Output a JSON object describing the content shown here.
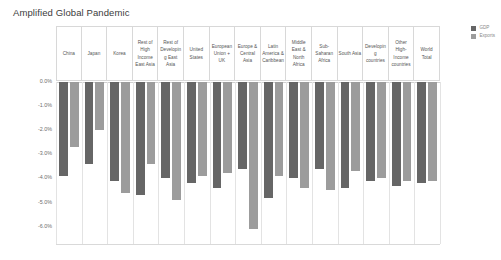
{
  "title": "Amplified Global Pandemic",
  "colors": {
    "gdp": "#666666",
    "exports": "#9c9c9c",
    "gridline": "#d8d8d8",
    "axis_text": "#6d6d6d",
    "title_text": "#3b3b3b",
    "background": "#ffffff"
  },
  "legend": {
    "position": "right-top",
    "items": [
      {
        "label": "GDP",
        "color": "#666666"
      },
      {
        "label": "Exports",
        "color": "#9c9c9c"
      }
    ]
  },
  "axis": {
    "y_ticks": [
      "0.0%",
      "-1.0%",
      "-2.0%",
      "-3.0%",
      "-4.0%",
      "-5.0%",
      "-6.0%"
    ],
    "y_tick_values": [
      0,
      -1,
      -2,
      -3,
      -4,
      -5,
      -6
    ]
  },
  "chart_data": {
    "type": "bar",
    "title": "Amplified Global Pandemic",
    "xlabel": "",
    "ylabel": "",
    "ylim": [
      -6.5,
      0
    ],
    "grid": false,
    "legend_position": "right-top",
    "categories": [
      "China",
      "Japan",
      "Korea",
      "Rest of High Income East Asia",
      "Rest of Developing East Asia",
      "United States",
      "European Union + UK",
      "Europe & Central Asia",
      "Latin America & Caribbean",
      "Middle East & North Africa",
      "Sub-Saharan Africa",
      "South Asia",
      "Developing countries",
      "Other High-Income countries",
      "World Total"
    ],
    "series": [
      {
        "name": "GDP",
        "color": "#666666",
        "values": [
          -3.9,
          -3.4,
          -4.1,
          -4.7,
          -4.0,
          -4.2,
          -4.4,
          -3.6,
          -4.8,
          -4.0,
          -3.6,
          -4.4,
          -4.1,
          -4.3,
          -4.2
        ]
      },
      {
        "name": "Exports",
        "color": "#9c9c9c",
        "values": [
          -2.7,
          -2.0,
          -4.6,
          -3.4,
          -4.9,
          -3.9,
          -3.8,
          -6.1,
          -3.9,
          -4.4,
          -4.5,
          -3.7,
          -4.0,
          -4.1,
          -4.1
        ]
      }
    ]
  }
}
